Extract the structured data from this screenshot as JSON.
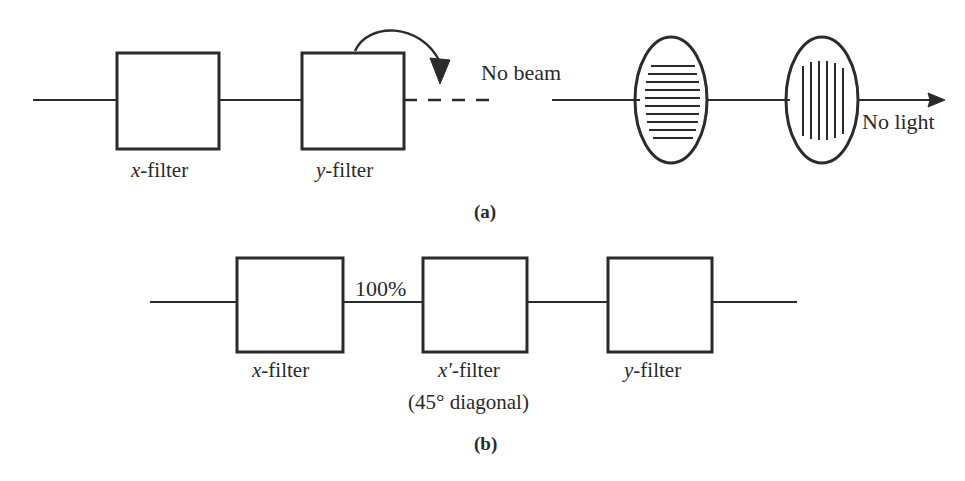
{
  "figure": {
    "stroke_color": "#2b2b2b",
    "background": "#ffffff"
  },
  "panel_a": {
    "panel_label": "(a)",
    "left_setup": {
      "boxes": [
        {
          "name": "x-filter-box-a",
          "label_var": "x",
          "label_rest": "-filter"
        },
        {
          "name": "y-filter-box-a",
          "label_var": "y",
          "label_rest": "-filter"
        }
      ],
      "beam_label": "No beam",
      "rotation_arrow": "curved-rotation-arrow"
    },
    "right_setup": {
      "ellipses": [
        {
          "name": "horizontal-polarizer",
          "orientation": "horizontal",
          "line_count": 10
        },
        {
          "name": "vertical-polarizer",
          "orientation": "vertical",
          "line_count": 6
        }
      ],
      "output_label": "No light"
    }
  },
  "panel_b": {
    "panel_label": "(b)",
    "transmission_label": "100%",
    "boxes": [
      {
        "name": "x-filter-box-b",
        "label_var": "x",
        "label_rest": "-filter",
        "sub_label": ""
      },
      {
        "name": "x-prime-filter-box-b",
        "label_var": "x′",
        "label_rest": "-filter",
        "sub_label": "(45° diagonal)"
      },
      {
        "name": "y-filter-box-b",
        "label_var": "y",
        "label_rest": "-filter",
        "sub_label": ""
      }
    ]
  }
}
